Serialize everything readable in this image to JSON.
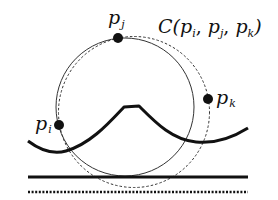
{
  "diagram": {
    "labels": {
      "p_i": {
        "base": "p",
        "sub": "i"
      },
      "p_j": {
        "base": "p",
        "sub": "j"
      },
      "p_k": {
        "base": "p",
        "sub": "k"
      },
      "circle": {
        "prefix": "C(",
        "a": "p",
        "a_sub": "i",
        "sep1": ", ",
        "b": "p",
        "b_sub": "j",
        "sep2": ", ",
        "c": "p",
        "c_sub": "k",
        "suffix": ")"
      }
    },
    "colors": {
      "stroke": "#111111",
      "background": "#ffffff"
    }
  }
}
